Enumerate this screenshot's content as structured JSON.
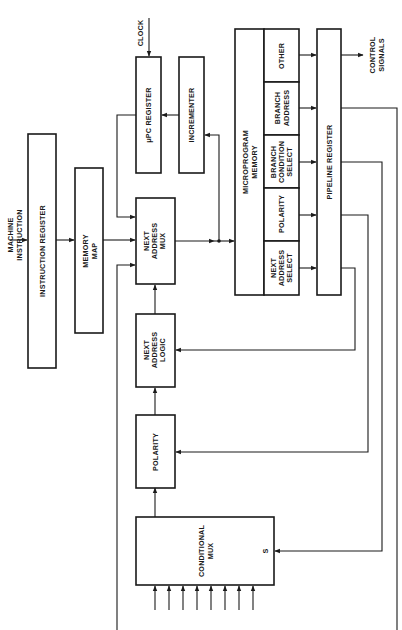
{
  "diagram": {
    "orientation": "rotated-90-ccw",
    "blocks": {
      "instruction_register": "INSTRUCTION REGISTER",
      "memory_map": [
        "MEMORY",
        "MAP"
      ],
      "upc_register": "μPC REGISTER",
      "incrementer": "INCREMENTER",
      "next_address_mux": [
        "NEXT",
        "ADDRESS",
        "MUX"
      ],
      "next_address_logic": [
        "NEXT",
        "ADDRESS",
        "LOGIC"
      ],
      "polarity": "POLARITY",
      "conditional_mux": [
        "CONDITIONAL",
        "MUX"
      ],
      "conditional_mux_select": "S",
      "microprogram_memory": [
        "MICROPROGRAM",
        "MEMORY"
      ],
      "pipeline_register": "PIPELINE REGISTER"
    },
    "microword_fields": [
      {
        "label": [
          "OTHER"
        ]
      },
      {
        "label": [
          "BRANCH",
          "ADDRESS"
        ]
      },
      {
        "label": [
          "BRANCH",
          "CONDITION",
          "SELECT"
        ]
      },
      {
        "label": [
          "POLARITY"
        ]
      },
      {
        "label": [
          "NEXT",
          "ADDRESS",
          "SELECT"
        ]
      }
    ],
    "signals": {
      "machine_instruction": [
        "MACHINE",
        "INSTRUCTION"
      ],
      "clock": "CLOCK",
      "control_signals": [
        "CONTROL",
        "SIGNALS"
      ]
    },
    "condition_inputs_count": 8
  }
}
